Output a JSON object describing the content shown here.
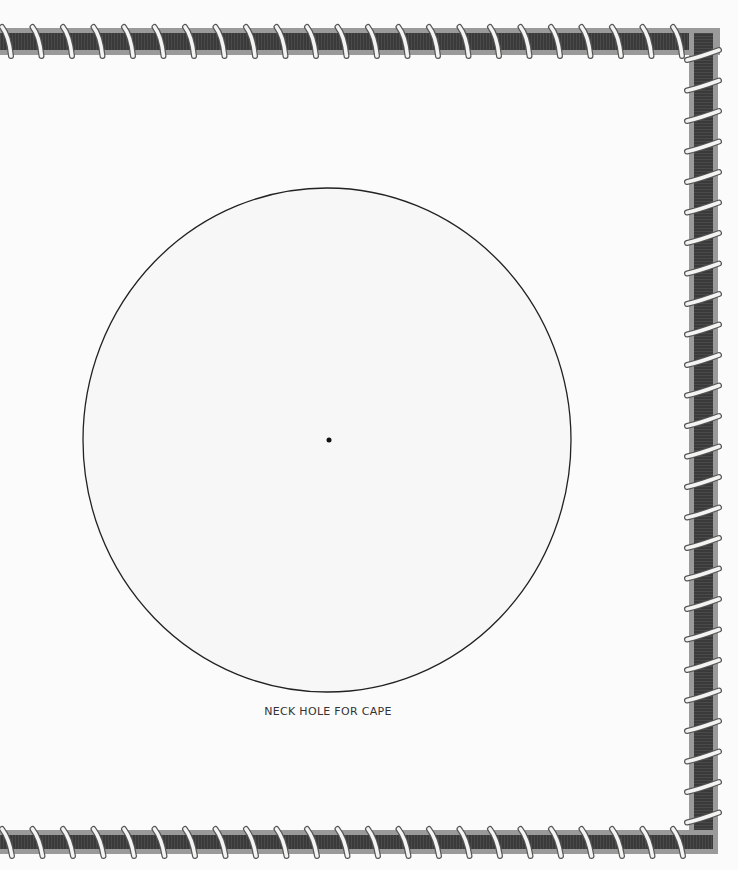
{
  "template": {
    "caption": "NECK HOLE FOR CAPE",
    "shape": {
      "type": "circle-template",
      "center": [
        327,
        440
      ],
      "rx": 244,
      "ry": 252,
      "center_mark": true
    },
    "frame": {
      "style": "rope-wrapped border",
      "sides": [
        "top",
        "right",
        "bottom"
      ],
      "colors": {
        "band_fill": "#3e3e3e",
        "band_edge": "#9a9a9a",
        "wrap": "#f4f4f2",
        "wrap_outline": "#555555"
      }
    },
    "background": "#fbfbfb"
  }
}
